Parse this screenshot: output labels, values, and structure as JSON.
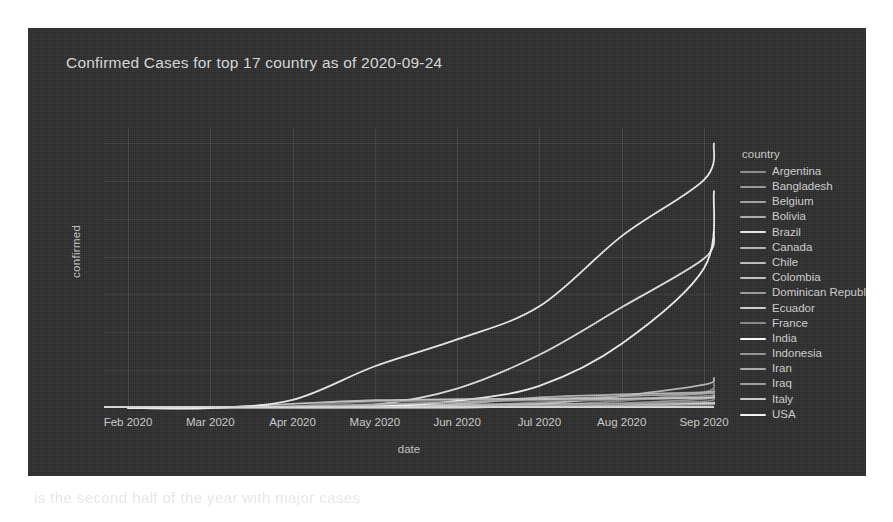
{
  "figure": {
    "title": "Confirmed Cases for top 17 country as of 2020-09-24",
    "background_color": "#2e2e2e",
    "text_color": "#d2d2d2"
  },
  "page": {
    "ghost_text": "is the second half of the year with major cases"
  },
  "legend": {
    "title": "country",
    "position": "right"
  },
  "chart_data": {
    "type": "line",
    "title": "Confirmed Cases for top 17 country as of 2020-09-24",
    "xlabel": "date",
    "ylabel": "confirmed",
    "grid": true,
    "legend_title": "country",
    "legend_position": "right",
    "x_tick_labels": [
      "Feb 2020",
      "Mar 2020",
      "Apr 2020",
      "May 2020",
      "Jun 2020",
      "Jul 2020",
      "Aug 2020",
      "Sep 2020"
    ],
    "y_tick_labels": [
      "0",
      "1M",
      "2M",
      "3M",
      "4M",
      "5M",
      "6M",
      "7M"
    ],
    "y_tick_values": [
      0,
      1000000,
      2000000,
      3000000,
      4000000,
      5000000,
      6000000,
      7000000
    ],
    "ylim": [
      0,
      7400000
    ],
    "xlim": [
      "2020-01-22",
      "2020-09-24"
    ],
    "x": [
      "2020-02-01",
      "2020-03-01",
      "2020-04-01",
      "2020-05-01",
      "2020-06-01",
      "2020-07-01",
      "2020-08-01",
      "2020-09-01",
      "2020-09-24"
    ],
    "series": [
      {
        "name": "Argentina",
        "color": "#8f8f8f",
        "values": [
          0,
          0,
          1054,
          4532,
          16851,
          64530,
          191302,
          417735,
          664799
        ]
      },
      {
        "name": "Bangladesh",
        "color": "#9a9a9a",
        "values": [
          0,
          0,
          56,
          7103,
          47153,
          145483,
          234889,
          312996,
          353844
        ]
      },
      {
        "name": "Belgium",
        "color": "#a5a5a5",
        "values": [
          0,
          1,
          13964,
          48519,
          58615,
          61427,
          70314,
          88367,
          113190
        ]
      },
      {
        "name": "Bolivia",
        "color": "#b0b0b0",
        "values": [
          0,
          0,
          115,
          1594,
          9982,
          36818,
          78793,
          116598,
          132618
        ]
      },
      {
        "name": "Brazil",
        "color": "#efefef",
        "values": [
          0,
          2,
          6836,
          87187,
          514849,
          1408485,
          2662485,
          3950931,
          4657702
        ]
      },
      {
        "name": "Canada",
        "color": "#bbbbbb",
        "values": [
          0,
          18,
          9560,
          55061,
          91681,
          104271,
          116884,
          129342,
          148323
        ]
      },
      {
        "name": "Chile",
        "color": "#c0c0c0",
        "values": [
          0,
          0,
          3031,
          17008,
          105159,
          282043,
          357658,
          414739,
          452325
        ]
      },
      {
        "name": "Colombia",
        "color": "#c6c6c6",
        "values": [
          0,
          0,
          1065,
          7006,
          30593,
          102009,
          317651,
          615168,
          790823
        ]
      },
      {
        "name": "Dominican Republic",
        "color": "#9d9d9d",
        "values": [
          0,
          0,
          1109,
          7288,
          17572,
          38128,
          80708,
          102232,
          111666
        ]
      },
      {
        "name": "Ecuador",
        "color": "#d2d2d2",
        "values": [
          0,
          0,
          2748,
          24934,
          39098,
          59468,
          100688,
          124963,
          132464
        ]
      },
      {
        "name": "France",
        "color": "#8a8a8a",
        "values": [
          0,
          130,
          52128,
          167178,
          188882,
          203218,
          219029,
          286007,
          497237
        ]
      },
      {
        "name": "India",
        "color": "#ffffff",
        "values": [
          1,
          3,
          1998,
          35043,
          190609,
          585493,
          1695988,
          3691166,
          5732518
        ]
      },
      {
        "name": "Indonesia",
        "color": "#959595",
        "values": [
          0,
          0,
          1677,
          10118,
          26473,
          56385,
          109936,
          177571,
          262022
        ]
      },
      {
        "name": "Iran",
        "color": "#aeaeae",
        "values": [
          0,
          978,
          44605,
          95646,
          154445,
          227662,
          309437,
          378752,
          439882
        ]
      },
      {
        "name": "Iraq",
        "color": "#a0a0a0",
        "values": [
          0,
          13,
          694,
          2153,
          6868,
          51524,
          124609,
          242284,
          335578
        ]
      },
      {
        "name": "Italy",
        "color": "#cfcfcf",
        "values": [
          2,
          1694,
          110574,
          205463,
          233019,
          240578,
          247537,
          269214,
          304323
        ]
      },
      {
        "name": "USA",
        "color": "#fbfbfb",
        "values": [
          8,
          74,
          213372,
          1103461,
          1811277,
          2686587,
          4542579,
          6030587,
          6990000
        ]
      }
    ]
  }
}
